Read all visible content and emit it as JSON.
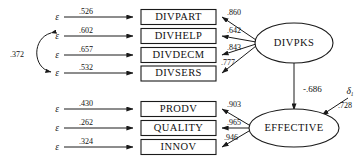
{
  "diagram": {
    "type": "structural-equation-model-path-diagram",
    "error_symbol": "ε",
    "disturbance_symbol": "δ",
    "disturbance_subscript": "1",
    "latents": [
      {
        "id": "divpks",
        "label": "DIVPKS"
      },
      {
        "id": "effective",
        "label": "EFFECTIVE"
      }
    ],
    "indicators_top": [
      {
        "id": "divpart",
        "label": "DIVPART",
        "error_value": ".526",
        "loading": ".860"
      },
      {
        "id": "divhelp",
        "label": "DIVHELP",
        "error_value": ".602",
        "loading": ".642"
      },
      {
        "id": "divdecm",
        "label": "DIVDECM",
        "error_value": ".657",
        "loading": ".843"
      },
      {
        "id": "divsers",
        "label": "DIVSERS",
        "error_value": ".532",
        "loading": ".777"
      }
    ],
    "indicators_bottom": [
      {
        "id": "prodv",
        "label": "PRODV",
        "error_value": ".430",
        "loading": ".903"
      },
      {
        "id": "quality",
        "label": "QUALITY",
        "error_value": ".262",
        "loading": ".965"
      },
      {
        "id": "innov",
        "label": "INNOV",
        "error_value": ".324",
        "loading": ".946"
      }
    ],
    "error_covariance": {
      "value": ".372",
      "between": [
        "divhelp",
        "divsers"
      ]
    },
    "structural_path": {
      "value": "-.686",
      "from": "divpks",
      "to": "effective"
    },
    "disturbance": {
      "value": ".728",
      "on": "effective"
    }
  }
}
